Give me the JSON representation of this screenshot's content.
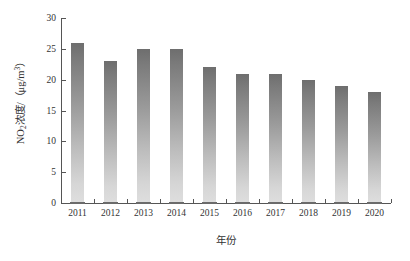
{
  "chart_data": {
    "type": "bar",
    "title": "",
    "xlabel": "年份",
    "ylabel_plain": "NO2浓度/（μg/m3）",
    "categories": [
      "2011",
      "2012",
      "2013",
      "2014",
      "2015",
      "2016",
      "2017",
      "2018",
      "2019",
      "2020"
    ],
    "values": [
      26,
      23,
      25,
      25,
      22,
      21,
      21,
      20,
      19,
      18
    ],
    "ylim": [
      0,
      30
    ],
    "ytick_labels": [
      "0",
      "5",
      "10",
      "15",
      "20",
      "25",
      "30"
    ],
    "ytick_values": [
      0,
      5,
      10,
      15,
      20,
      25,
      30
    ],
    "grid": false,
    "legend": false,
    "series": [
      {
        "name": "NO2浓度",
        "values": [
          26,
          23,
          25,
          25,
          22,
          21,
          21,
          20,
          19,
          18
        ]
      }
    ],
    "bar_fill": "vertical gradient dark gray (top) to light gray (bottom)",
    "colors": {
      "bar_top": "#6e6e6e",
      "bar_bottom": "#dedede",
      "axis": "#555555",
      "text": "#333333",
      "background": "#ffffff"
    }
  },
  "ylabel_parts": {
    "prefix": "NO",
    "sub": "2",
    "mid": "浓度/（μg/m",
    "sup": "3",
    "suffix": "）"
  }
}
